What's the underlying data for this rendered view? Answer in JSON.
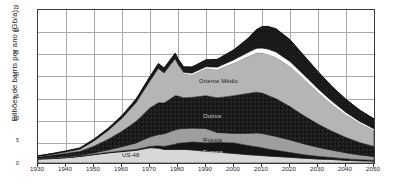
{
  "chart": {
    "ylabel": "Bilhões de barris por ano (Gb/a)",
    "yticks": [
      "0",
      "5",
      "10",
      "15",
      "20",
      "25",
      "30",
      "35"
    ],
    "xticks": [
      "1930",
      "1940",
      "1950",
      "1960",
      "1970",
      "1980",
      "1990",
      "2000",
      "2010",
      "2020",
      "2030",
      "2040",
      "2050"
    ],
    "series_labels": {
      "oriente_medio": "Oriente Médio",
      "outros": "Outros",
      "russia": "Rússia",
      "europa": "Europa",
      "us48": "US-48"
    }
  },
  "chart_data": {
    "type": "area",
    "title": "",
    "xlabel": "",
    "ylabel": "Bilhões de barris por ano (Gb/a)",
    "xlim": [
      1930,
      2050
    ],
    "ylim": [
      0,
      35
    ],
    "ytick_values": [
      0,
      5,
      10,
      15,
      20,
      25,
      30,
      35
    ],
    "xtick_values": [
      1930,
      1940,
      1950,
      1960,
      1970,
      1980,
      1990,
      2000,
      2010,
      2020,
      2030,
      2040,
      2050
    ],
    "grid": true,
    "legend": "inline-annotations",
    "stacked": true,
    "stack_order_bottom_to_top": [
      "US-48",
      "Europa",
      "Rússia",
      "Outros",
      "Oriente Médio",
      "Águas profundas / Polar",
      "Outros líquidos"
    ],
    "x": [
      1930,
      1935,
      1940,
      1945,
      1950,
      1955,
      1960,
      1965,
      1970,
      1973,
      1975,
      1979,
      1980,
      1982,
      1985,
      1990,
      1994,
      2000,
      2005,
      2008,
      2010,
      2012,
      2015,
      2020,
      2025,
      2030,
      2035,
      2040,
      2045,
      2050
    ],
    "series": [
      {
        "name": "US-48",
        "color": "#d8d8d8",
        "values": [
          0.9,
          1.0,
          1.2,
          1.5,
          1.9,
          2.3,
          2.6,
          2.9,
          3.5,
          3.4,
          3.1,
          3.1,
          3.1,
          3.1,
          3.0,
          2.7,
          2.5,
          2.2,
          1.9,
          1.8,
          1.7,
          1.6,
          1.5,
          1.3,
          1.1,
          0.9,
          0.8,
          0.6,
          0.5,
          0.4
        ]
      },
      {
        "name": "Europa",
        "color": "#151515",
        "values": [
          0.05,
          0.05,
          0.05,
          0.05,
          0.1,
          0.1,
          0.15,
          0.2,
          0.3,
          0.5,
          0.7,
          1.2,
          1.4,
          1.5,
          1.8,
          1.9,
          2.2,
          2.4,
          2.1,
          1.9,
          1.8,
          1.6,
          1.4,
          1.1,
          0.8,
          0.6,
          0.45,
          0.35,
          0.25,
          0.2
        ]
      },
      {
        "name": "Rússia",
        "color": "#9e9e9e",
        "values": [
          0.15,
          0.2,
          0.25,
          0.2,
          0.35,
          0.6,
          1.0,
          1.5,
          2.2,
          2.6,
          2.9,
          3.3,
          3.3,
          3.3,
          3.2,
          3.3,
          2.3,
          2.2,
          2.8,
          3.2,
          3.3,
          3.3,
          3.2,
          2.9,
          2.5,
          2.1,
          1.7,
          1.4,
          1.1,
          0.9
        ]
      },
      {
        "name": "Outros",
        "color": "#1c1c1c",
        "values": [
          0.3,
          0.5,
          0.7,
          0.9,
          1.5,
          2.4,
          3.5,
          4.9,
          6.6,
          7.3,
          7.0,
          7.8,
          7.5,
          7.0,
          7.0,
          7.5,
          7.9,
          8.6,
          9.1,
          9.3,
          9.2,
          9.0,
          8.6,
          7.6,
          6.4,
          5.3,
          4.3,
          3.5,
          2.8,
          2.3
        ]
      },
      {
        "name": "Oriente Médio",
        "color": "#b5b5b5",
        "values": [
          0.1,
          0.2,
          0.3,
          0.5,
          1.2,
          2.0,
          3.0,
          4.3,
          6.2,
          7.8,
          6.8,
          8.2,
          7.0,
          5.5,
          5.2,
          6.2,
          6.5,
          7.5,
          8.5,
          9.0,
          9.2,
          9.4,
          9.5,
          9.2,
          8.4,
          7.3,
          6.2,
          5.2,
          4.4,
          3.7
        ]
      },
      {
        "name": "Águas profundas / Polar",
        "color": "#ffffff",
        "values": [
          0,
          0,
          0,
          0,
          0,
          0,
          0,
          0,
          0,
          0.05,
          0.1,
          0.2,
          0.25,
          0.3,
          0.35,
          0.4,
          0.5,
          0.7,
          0.9,
          1.0,
          1.1,
          1.15,
          1.2,
          1.1,
          0.95,
          0.8,
          0.65,
          0.5,
          0.4,
          0.3
        ]
      },
      {
        "name": "Outros líquidos",
        "color": "#222222",
        "values": [
          0.15,
          0.2,
          0.25,
          0.3,
          0.4,
          0.5,
          0.6,
          0.8,
          1.0,
          1.1,
          1.1,
          1.3,
          1.3,
          1.3,
          1.4,
          1.6,
          1.8,
          2.3,
          3.2,
          4.3,
          4.9,
          5.2,
          5.3,
          5.0,
          4.4,
          3.9,
          3.4,
          3.0,
          2.6,
          2.3
        ]
      }
    ],
    "total_peak": {
      "year": 2010,
      "value": 30.6
    }
  }
}
